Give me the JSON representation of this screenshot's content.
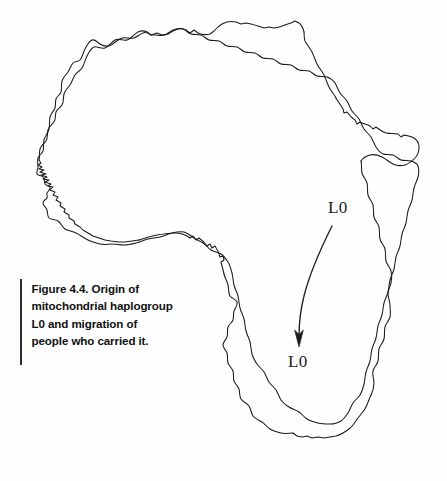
{
  "figure": {
    "caption": "Figure 4.4. Origin of\nmitochondrial haplogroup\nL0 and migration of\npeople who carried it.",
    "caption_lines": [
      "Figure 4.4. Origin of",
      "mitochondrial haplogroup",
      "L0 and migration of",
      "people who carried it."
    ],
    "background_color": "#fefefe",
    "outline_color": "#1a1a1a",
    "text_color": "#111111",
    "rule_color": "#2b2b2b"
  },
  "map": {
    "subject": "africa-continent-outline",
    "labels": {
      "origin": "L0",
      "destination": "L0"
    },
    "arrow": {
      "name": "migration-arrow",
      "from_label": "L0",
      "to_label": "L0",
      "direction": "south-southwest"
    }
  }
}
